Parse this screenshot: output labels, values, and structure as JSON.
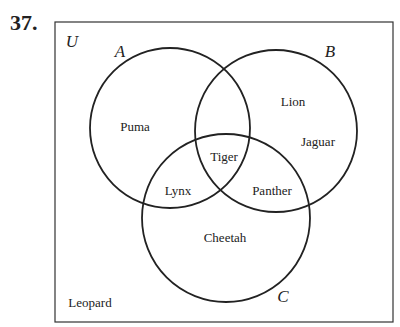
{
  "problem_number": "37.",
  "universe_label": "U",
  "sets": {
    "A": "A",
    "B": "B",
    "C": "C"
  },
  "regions": {
    "A_only": "Puma",
    "B_only_1": "Lion",
    "B_only_2": "Jaguar",
    "A_B_C": "Tiger",
    "A_C_only": "Lynx",
    "B_C_only": "Panther",
    "C_only": "Cheetah",
    "outside": "Leopard"
  }
}
